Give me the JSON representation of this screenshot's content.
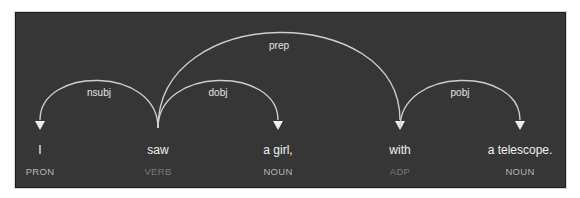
{
  "diagram": {
    "type": "dependency-parse",
    "sentence": "I saw a girl, with a telescope.",
    "colors": {
      "background": "#363636",
      "arc": "#cfcfcf",
      "word": "#f2f2f2",
      "tag": "#b5b5b5",
      "tag_dim": "#7a7a7a"
    },
    "tokens": [
      {
        "text": "I",
        "tag": "PRON",
        "x": 40,
        "tag_dim": false
      },
      {
        "text": "saw",
        "tag": "VERB",
        "x": 158,
        "tag_dim": true
      },
      {
        "text": "a girl,",
        "tag": "NOUN",
        "x": 278,
        "tag_dim": false
      },
      {
        "text": "with",
        "tag": "ADP",
        "x": 400,
        "tag_dim": true
      },
      {
        "text": "a telescope.",
        "tag": "NOUN",
        "x": 520,
        "tag_dim": false
      }
    ],
    "arcs": [
      {
        "label": "nsubj",
        "head": 1,
        "dependent": 0
      },
      {
        "label": "dobj",
        "head": 1,
        "dependent": 2
      },
      {
        "label": "prep",
        "head": 1,
        "dependent": 3
      },
      {
        "label": "pobj",
        "head": 3,
        "dependent": 4
      }
    ]
  }
}
